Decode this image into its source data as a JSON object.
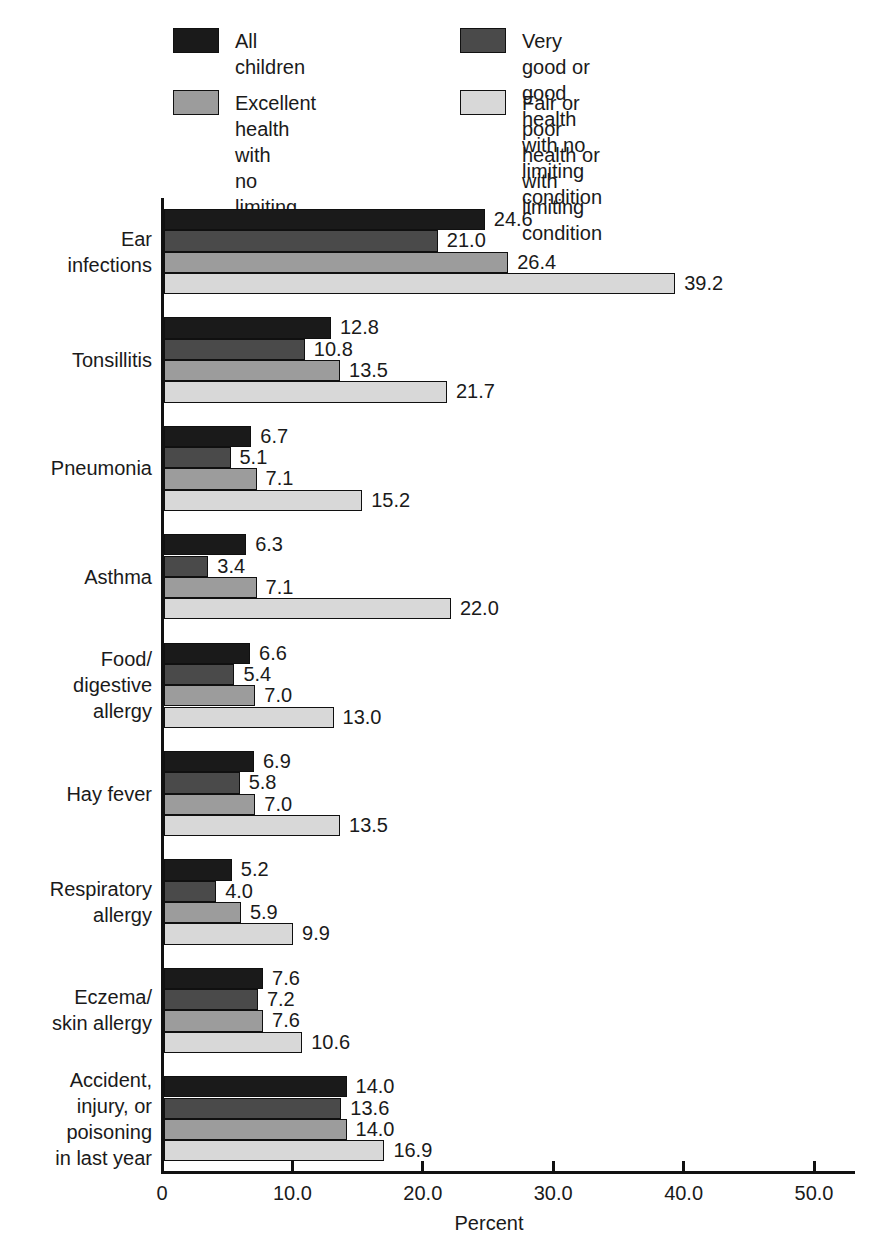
{
  "legend": {
    "items": [
      {
        "label": "All children",
        "color": "#1a1a1a"
      },
      {
        "label": "Very good or good health\nwith no limiting condition",
        "color": "#4a4a4a"
      },
      {
        "label": "Excellent health with\nno limiting condition",
        "color": "#9c9c9c"
      },
      {
        "label": "Fair or poor health or\nwith limiting condition",
        "color": "#d8d8d8"
      }
    ]
  },
  "chart_data": {
    "type": "bar",
    "orientation": "horizontal",
    "title": "",
    "xlabel": "Percent",
    "xlim": [
      0,
      53
    ],
    "grid": false,
    "legend_position": "top",
    "value_labels_decimals": 1,
    "categories": [
      "Ear\ninfections",
      "Tonsillitis",
      "Pneumonia",
      "Asthma",
      "Food/\ndigestive\nallergy",
      "Hay fever",
      "Respiratory\nallergy",
      "Eczema/\nskin allergy",
      "Accident,\ninjury, or\npoisoning\nin last year"
    ],
    "series": [
      {
        "name": "All children",
        "color": "#1a1a1a",
        "values": [
          24.6,
          12.8,
          6.7,
          6.3,
          6.6,
          6.9,
          5.2,
          7.6,
          14.0
        ]
      },
      {
        "name": "Very good or good health with no limiting condition",
        "color": "#4a4a4a",
        "values": [
          21.0,
          10.8,
          5.1,
          3.4,
          5.4,
          5.8,
          4.0,
          7.2,
          13.6
        ]
      },
      {
        "name": "Excellent health with no limiting condition",
        "color": "#9c9c9c",
        "values": [
          26.4,
          13.5,
          7.1,
          7.1,
          7.0,
          7.0,
          5.9,
          7.6,
          14.0
        ]
      },
      {
        "name": "Fair or poor health or with limiting condition",
        "color": "#d8d8d8",
        "values": [
          39.2,
          21.7,
          15.2,
          22.0,
          13.0,
          13.5,
          9.9,
          10.6,
          16.9
        ]
      }
    ],
    "xticks": [
      {
        "value": 0,
        "label": "0"
      },
      {
        "value": 10,
        "label": "10.0"
      },
      {
        "value": 20,
        "label": "20.0"
      },
      {
        "value": 30,
        "label": "30.0"
      },
      {
        "value": 40,
        "label": "40.0"
      },
      {
        "value": 50,
        "label": "50.0"
      }
    ]
  }
}
